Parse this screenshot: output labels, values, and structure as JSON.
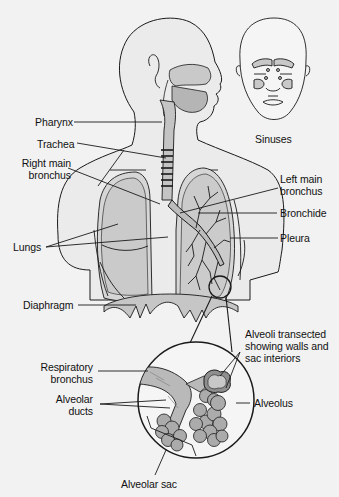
{
  "diagram": {
    "colors": {
      "background": "#f2f2f2",
      "outline": "#1a1a1a",
      "lung_fill": "#cfcfcf",
      "lung_dark": "#b8b8b8",
      "airway_fill": "#bdbdbd",
      "alveoli_fill": "#a9a9a9",
      "body_fill": "#e6e6e6"
    },
    "labels": {
      "pharynx": "Pharynx",
      "trachea": "Trachea",
      "right_main_bronchus_1": "Right main",
      "right_main_bronchus_2": "bronchus",
      "left_main_bronchus_1": "Left main",
      "left_main_bronchus_2": "bronchus",
      "bronchide": "Bronchide",
      "pleura": "Pleura",
      "lungs": "Lungs",
      "diaphragm": "Diaphragm",
      "sinuses": "Sinuses",
      "alveoli_transected_1": "Alveoli transected",
      "alveoli_transected_2": "showing walls and",
      "alveoli_transected_3": "sac interiors",
      "respiratory_bronchus_1": "Respiratory",
      "respiratory_bronchus_2": "bronchus",
      "alveolar_ducts_1": "Alveolar",
      "alveolar_ducts_2": "ducts",
      "alveolus": "Alveolus",
      "alveolar_sac": "Alveolar sac"
    }
  }
}
